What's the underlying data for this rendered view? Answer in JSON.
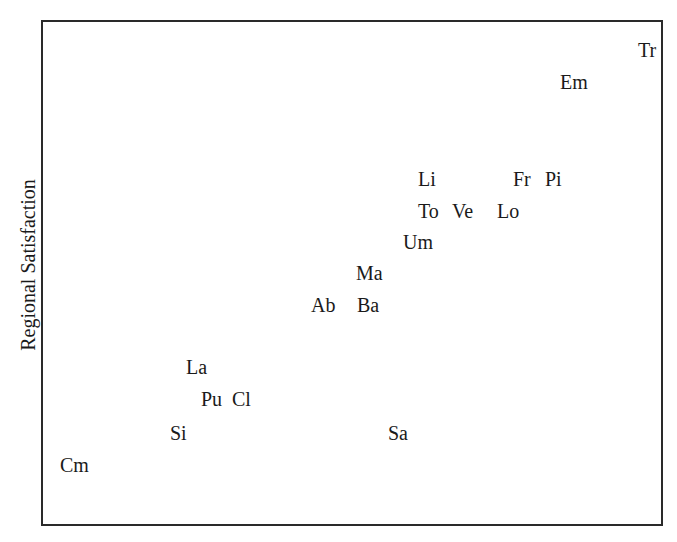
{
  "chart_data": {
    "type": "scatter",
    "title": "",
    "xlabel": "",
    "ylabel": "Regional Satisfaction",
    "grid": false,
    "legend": null,
    "note": "Text-label scatter; no axis ticks shown. Coordinates are pixel positions of label left/top within the 677x542 image.",
    "points": [
      {
        "label": "Tr",
        "x": 638,
        "y": 40
      },
      {
        "label": "Em",
        "x": 560,
        "y": 72
      },
      {
        "label": "Li",
        "x": 418,
        "y": 169
      },
      {
        "label": "Fr",
        "x": 513,
        "y": 169
      },
      {
        "label": "Pi",
        "x": 545,
        "y": 169
      },
      {
        "label": "To",
        "x": 418,
        "y": 201
      },
      {
        "label": "Ve",
        "x": 452,
        "y": 201
      },
      {
        "label": "Lo",
        "x": 497,
        "y": 201
      },
      {
        "label": "Um",
        "x": 403,
        "y": 232
      },
      {
        "label": "Ma",
        "x": 356,
        "y": 263
      },
      {
        "label": "Ab",
        "x": 311,
        "y": 295
      },
      {
        "label": "Ba",
        "x": 357,
        "y": 295
      },
      {
        "label": "La",
        "x": 186,
        "y": 357
      },
      {
        "label": "Pu",
        "x": 201,
        "y": 389
      },
      {
        "label": "Cl",
        "x": 232,
        "y": 389
      },
      {
        "label": "Si",
        "x": 170,
        "y": 423
      },
      {
        "label": "Sa",
        "x": 388,
        "y": 423
      },
      {
        "label": "Cm",
        "x": 60,
        "y": 455
      }
    ]
  }
}
